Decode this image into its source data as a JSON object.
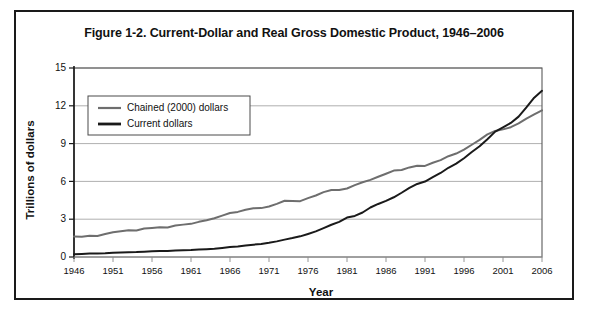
{
  "figure": {
    "title": "Figure 1-2. Current-Dollar and Real Gross Domestic Product, 1946–2006"
  },
  "colors": {
    "current_dollars": "#1a1a1a",
    "chained_dollars": "#6e6e6e",
    "gridline": "#9a9a9a",
    "axis": "#1a1a1a",
    "frame": "#5a5a5a",
    "background": "#ffffff",
    "card_border": "#1a1a1a"
  },
  "chart_data": {
    "type": "line",
    "title": "Figure 1-2. Current-Dollar and Real Gross Domestic Product, 1946–2006",
    "xlabel": "Year",
    "ylabel": "Trillions of dollars",
    "xlim": [
      1946,
      2006
    ],
    "ylim": [
      0,
      15
    ],
    "yticks": [
      0,
      3,
      6,
      9,
      12,
      15
    ],
    "ytick_labels": [
      "0",
      "3",
      "6",
      "9",
      "12",
      "15"
    ],
    "xticks": [
      1946,
      1951,
      1956,
      1961,
      1966,
      1971,
      1976,
      1981,
      1986,
      1991,
      1996,
      2001,
      2006
    ],
    "xtick_labels": [
      "1946",
      "1951",
      "1956",
      "1961",
      "1966",
      "1971",
      "1976",
      "1981",
      "1986",
      "1991",
      "1996",
      "2001",
      "2006"
    ],
    "grid": true,
    "grid_axis": "y",
    "legend_position": "upper-left-inside",
    "x": [
      1946,
      1947,
      1948,
      1949,
      1950,
      1951,
      1952,
      1953,
      1954,
      1955,
      1956,
      1957,
      1958,
      1959,
      1960,
      1961,
      1962,
      1963,
      1964,
      1965,
      1966,
      1967,
      1968,
      1969,
      1970,
      1971,
      1972,
      1973,
      1974,
      1975,
      1976,
      1977,
      1978,
      1979,
      1980,
      1981,
      1982,
      1983,
      1984,
      1985,
      1986,
      1987,
      1988,
      1989,
      1990,
      1991,
      1992,
      1993,
      1994,
      1995,
      1996,
      1997,
      1998,
      1999,
      2000,
      2001,
      2002,
      2003,
      2004,
      2005,
      2006
    ],
    "series": [
      {
        "name": "Chained (2000) dollars",
        "color": "#6e6e6e",
        "line_width": 2.0,
        "values": [
          1.62,
          1.61,
          1.68,
          1.67,
          1.82,
          1.96,
          2.04,
          2.13,
          2.11,
          2.26,
          2.31,
          2.36,
          2.34,
          2.5,
          2.57,
          2.63,
          2.79,
          2.91,
          3.08,
          3.28,
          3.49,
          3.58,
          3.75,
          3.87,
          3.88,
          4.01,
          4.22,
          4.46,
          4.44,
          4.43,
          4.67,
          4.88,
          5.15,
          5.32,
          5.31,
          5.44,
          5.7,
          5.93,
          6.12,
          6.37,
          6.61,
          6.86,
          6.91,
          7.11,
          7.25,
          7.23,
          7.48,
          7.69,
          8.0,
          8.21,
          8.52,
          8.91,
          9.3,
          9.73,
          10.0,
          10.13,
          10.3,
          10.6,
          10.99,
          11.32,
          11.64
        ]
      },
      {
        "name": "Current dollars",
        "color": "#1a1a1a",
        "line_width": 2.0,
        "values": [
          0.22,
          0.24,
          0.27,
          0.27,
          0.29,
          0.34,
          0.36,
          0.38,
          0.39,
          0.42,
          0.45,
          0.47,
          0.47,
          0.51,
          0.53,
          0.55,
          0.59,
          0.62,
          0.66,
          0.72,
          0.79,
          0.83,
          0.91,
          0.98,
          1.04,
          1.13,
          1.24,
          1.38,
          1.5,
          1.64,
          1.83,
          2.03,
          2.29,
          2.56,
          2.79,
          3.13,
          3.26,
          3.53,
          3.93,
          4.21,
          4.45,
          4.74,
          5.1,
          5.48,
          5.8,
          5.99,
          6.34,
          6.67,
          7.08,
          7.41,
          7.84,
          8.33,
          8.79,
          9.35,
          9.95,
          10.29,
          10.64,
          11.14,
          11.87,
          12.64,
          13.19
        ]
      }
    ],
    "notes": {
      "crossover_year": 2000,
      "crossover_value": 10.0
    }
  },
  "legend": {
    "entries": [
      {
        "label": "Chained (2000) dollars",
        "color": "#6e6e6e"
      },
      {
        "label": "Current dollars",
        "color": "#1a1a1a"
      }
    ]
  }
}
